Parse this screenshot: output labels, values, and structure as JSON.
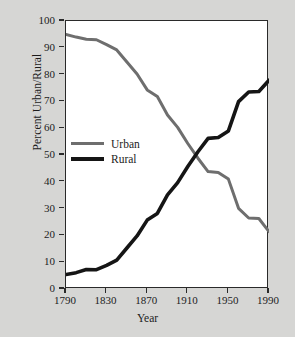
{
  "chart_data": {
    "type": "line",
    "title": "",
    "xlabel": "Year",
    "ylabel": "Percent Urban/Rural",
    "xlim": [
      1790,
      1990
    ],
    "ylim": [
      0,
      100
    ],
    "grid": false,
    "legend_position": "center-left",
    "xticks": [
      1790,
      1830,
      1870,
      1910,
      1950,
      1990
    ],
    "xtick_labels": [
      "1790",
      "1830",
      "1870",
      "1910",
      "1950",
      "1990"
    ],
    "yticks": [
      0,
      10,
      20,
      30,
      40,
      50,
      60,
      70,
      80,
      90,
      100
    ],
    "ytick_labels": [
      "0",
      "10",
      "20",
      "30",
      "40",
      "50",
      "60",
      "70",
      "80",
      "90",
      "100"
    ],
    "x": [
      1790,
      1800,
      1810,
      1820,
      1830,
      1840,
      1850,
      1860,
      1870,
      1880,
      1890,
      1900,
      1910,
      1920,
      1930,
      1940,
      1950,
      1960,
      1970,
      1980,
      1990
    ],
    "series": [
      {
        "name": "Urban",
        "color": "#6e6e6e",
        "width": 3.0,
        "values": [
          95.0,
          94.0,
          93.2,
          93.0,
          91.2,
          89.2,
          84.7,
          80.2,
          74.3,
          71.8,
          64.9,
          60.3,
          54.3,
          48.8,
          43.8,
          43.5,
          41.0,
          30.1,
          26.5,
          26.3,
          21.4
        ]
      },
      {
        "name": "Rural",
        "color": "#151515",
        "width": 3.6,
        "values": [
          5.4,
          6.1,
          7.3,
          7.2,
          8.8,
          10.8,
          15.3,
          19.8,
          25.7,
          28.2,
          35.1,
          39.7,
          45.7,
          51.2,
          56.2,
          56.5,
          59.0,
          69.9,
          73.5,
          73.7,
          77.9
        ]
      }
    ],
    "legend_entries": [
      {
        "label": "Urban",
        "color": "#6e6e6e"
      },
      {
        "label": "Rural",
        "color": "#151515"
      }
    ]
  },
  "figure": {
    "background_color": "#d6d6d4",
    "plot_background_color": "#ffffff",
    "frame_color": "#2a2a2a"
  }
}
